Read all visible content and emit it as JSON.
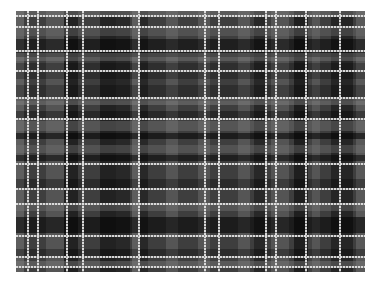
{
  "image": {
    "description": "Grayscale tartan / plaid fabric pattern",
    "region": {
      "left": 16,
      "top": 11,
      "width": 349,
      "height": 261
    },
    "base_color": "#3e3e3e",
    "vertical_bands": [
      {
        "x": 0,
        "w": 8,
        "color": "rgba(120,120,120,0.55)"
      },
      {
        "x": 30,
        "w": 18,
        "color": "rgba(110,110,110,0.45)"
      },
      {
        "x": 48,
        "w": 14,
        "color": "rgba(0,0,0,0.45)"
      },
      {
        "x": 84,
        "w": 16,
        "color": "rgba(0,0,0,0.45)"
      },
      {
        "x": 100,
        "w": 14,
        "color": "rgba(0,0,0,0.35)"
      },
      {
        "x": 116,
        "w": 8,
        "color": "rgba(130,130,130,0.45)"
      },
      {
        "x": 124,
        "w": 8,
        "color": "rgba(0,0,0,0.35)"
      },
      {
        "x": 150,
        "w": 12,
        "color": "rgba(130,130,130,0.35)"
      },
      {
        "x": 182,
        "w": 12,
        "color": "rgba(130,130,130,0.35)"
      },
      {
        "x": 222,
        "w": 12,
        "color": "rgba(130,130,130,0.35)"
      },
      {
        "x": 238,
        "w": 12,
        "color": "rgba(0,0,0,0.35)"
      },
      {
        "x": 255,
        "w": 18,
        "color": "rgba(110,110,110,0.45)"
      },
      {
        "x": 278,
        "w": 18,
        "color": "rgba(0,0,0,0.5)"
      },
      {
        "x": 292,
        "w": 12,
        "color": "rgba(120,120,120,0.4)"
      },
      {
        "x": 315,
        "w": 22,
        "color": "rgba(0,0,0,0.4)"
      },
      {
        "x": 340,
        "w": 9,
        "color": "rgba(120,120,120,0.45)"
      }
    ],
    "horizontal_bands": [
      {
        "y": 0,
        "h": 6,
        "color": "rgba(120,120,120,0.5)"
      },
      {
        "y": 17,
        "h": 8,
        "color": "rgba(110,110,110,0.4)"
      },
      {
        "y": 28,
        "h": 18,
        "color": "rgba(0,0,0,0.5)"
      },
      {
        "y": 42,
        "h": 8,
        "color": "rgba(130,130,130,0.4)"
      },
      {
        "y": 52,
        "h": 16,
        "color": "rgba(0,0,0,0.25)"
      },
      {
        "y": 74,
        "h": 16,
        "color": "rgba(0,0,0,0.25)"
      },
      {
        "y": 88,
        "h": 6,
        "color": "rgba(140,140,140,0.4)"
      },
      {
        "y": 100,
        "h": 8,
        "color": "rgba(0,0,0,0.35)"
      },
      {
        "y": 110,
        "h": 10,
        "color": "rgba(120,120,120,0.4)"
      },
      {
        "y": 122,
        "h": 6,
        "color": "rgba(0,0,0,0.55)"
      },
      {
        "y": 134,
        "h": 8,
        "color": "rgba(120,120,120,0.35)"
      },
      {
        "y": 144,
        "h": 6,
        "color": "rgba(0,0,0,0.5)"
      },
      {
        "y": 168,
        "h": 10,
        "color": "rgba(0,0,0,0.3)"
      },
      {
        "y": 192,
        "h": 8,
        "color": "rgba(130,130,130,0.35)"
      },
      {
        "y": 206,
        "h": 16,
        "color": "rgba(0,0,0,0.55)"
      },
      {
        "y": 238,
        "h": 8,
        "color": "rgba(0,0,0,0.3)"
      },
      {
        "y": 250,
        "h": 5,
        "color": "rgba(130,130,130,0.4)"
      }
    ],
    "vertical_lines": [
      11,
      21,
      50,
      66,
      122,
      188,
      202,
      249,
      259,
      289,
      323
    ],
    "horizontal_lines": [
      4,
      15,
      39,
      59,
      86,
      107,
      152,
      177,
      192,
      224,
      245,
      255
    ]
  }
}
